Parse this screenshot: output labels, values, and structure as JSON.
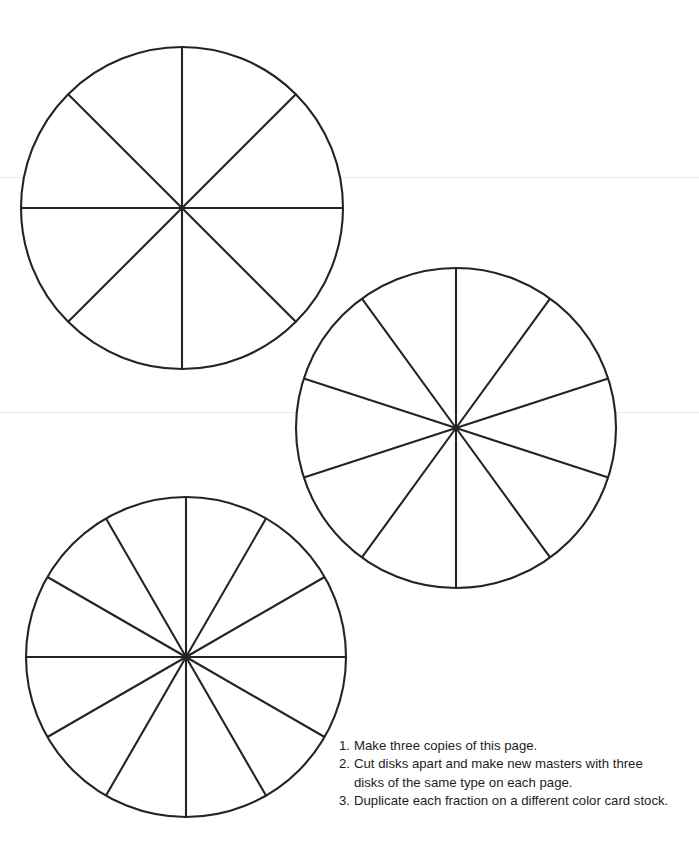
{
  "page": {
    "background_color": "#ffffff",
    "width": 699,
    "height": 848,
    "line_color": "#242424",
    "text_color": "#1d1d1d",
    "scan_line_color": "#e9eaec"
  },
  "chart_data": {
    "type": "pie",
    "xlabel": "",
    "ylabel": "",
    "grid": false,
    "legend": "none",
    "disks": [
      {
        "name": "eighths-disk",
        "label": "Eighths",
        "sectors": 8,
        "sector_fraction": "1/8",
        "sector_angle_deg": 45,
        "center_x": 182,
        "center_y": 208,
        "radius": 161,
        "categories": [
          "1/8",
          "1/8",
          "1/8",
          "1/8",
          "1/8",
          "1/8",
          "1/8",
          "1/8"
        ],
        "values": [
          12.5,
          12.5,
          12.5,
          12.5,
          12.5,
          12.5,
          12.5,
          12.5
        ]
      },
      {
        "name": "tenths-disk",
        "label": "Tenths",
        "sectors": 10,
        "sector_fraction": "1/10",
        "sector_angle_deg": 36,
        "center_x": 456,
        "center_y": 428,
        "radius": 160,
        "categories": [
          "1/10",
          "1/10",
          "1/10",
          "1/10",
          "1/10",
          "1/10",
          "1/10",
          "1/10",
          "1/10",
          "1/10"
        ],
        "values": [
          10,
          10,
          10,
          10,
          10,
          10,
          10,
          10,
          10,
          10
        ]
      },
      {
        "name": "twelfths-disk",
        "label": "Twelfths",
        "sectors": 12,
        "sector_fraction": "1/12",
        "sector_angle_deg": 30,
        "center_x": 186,
        "center_y": 657,
        "radius": 160,
        "categories": [
          "1/12",
          "1/12",
          "1/12",
          "1/12",
          "1/12",
          "1/12",
          "1/12",
          "1/12",
          "1/12",
          "1/12",
          "1/12",
          "1/12"
        ],
        "values": [
          8.33,
          8.33,
          8.33,
          8.33,
          8.33,
          8.33,
          8.33,
          8.33,
          8.33,
          8.33,
          8.33,
          8.33
        ]
      }
    ]
  },
  "instructions": {
    "items": [
      {
        "number": "1.",
        "text": "Make three copies of this page."
      },
      {
        "number": "2.",
        "text": "Cut disks apart and make new masters with three disks of the same type on each page."
      },
      {
        "number": "3.",
        "text": "Duplicate each fraction on a different color card stock."
      }
    ]
  }
}
